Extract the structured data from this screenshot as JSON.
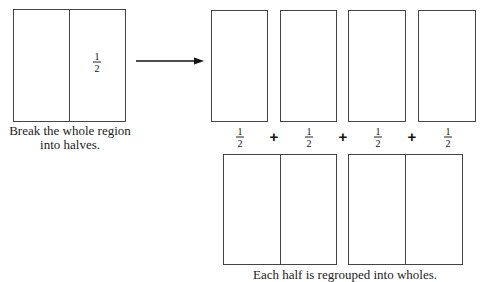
{
  "whole_region": {
    "fraction": {
      "numerator": "1",
      "denominator": "2"
    },
    "caption_line1": "Break the whole region",
    "caption_line2": "into halves."
  },
  "halves_row": {
    "fractions": [
      {
        "numerator": "1",
        "denominator": "2"
      },
      {
        "numerator": "1",
        "denominator": "2"
      },
      {
        "numerator": "1",
        "denominator": "2"
      },
      {
        "numerator": "1",
        "denominator": "2"
      }
    ],
    "operators": [
      "+",
      "+",
      "+"
    ]
  },
  "bottom_caption_partial": "Each half is regrouped into wholes.",
  "colors": {
    "stroke": "#444444",
    "background": "#ffffff"
  }
}
